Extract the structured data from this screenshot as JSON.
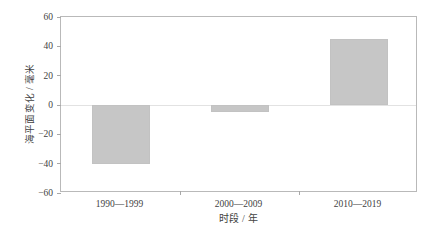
{
  "chart_data": {
    "type": "bar",
    "title": "",
    "categories": [
      "1990—1999",
      "2000—2009",
      "2010—2019"
    ],
    "values": [
      -40,
      -5,
      45
    ],
    "series": [
      {
        "name": "海平面变化",
        "values": [
          -40,
          -5,
          45
        ]
      }
    ],
    "xlabel": "时段 / 年",
    "ylabel": "海平面变化 / 毫米",
    "ylim": [
      -60,
      60
    ],
    "yticks": [
      60,
      40,
      20,
      0,
      -20,
      -40,
      -60
    ],
    "ytick_labels": [
      "60",
      "40",
      "20",
      "0",
      "−20",
      "−40",
      "−60"
    ],
    "grid": false,
    "zero_line": true,
    "legend": null,
    "legend_position": "none",
    "bar_color": "#c6c6c6",
    "axis_color": "#b9b9b9",
    "text_color": "#3f3f3f"
  }
}
